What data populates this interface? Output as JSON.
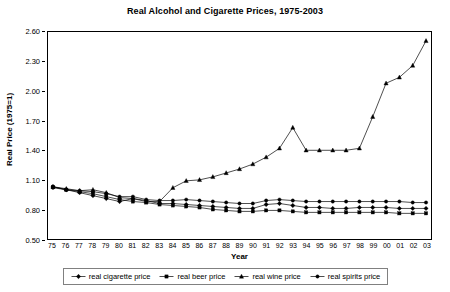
{
  "chart_data": {
    "type": "line",
    "title": "Real Alcohol and Cigarette Prices, 1975-2003",
    "xlabel": "Year",
    "ylabel": "Real Price (1975=1)",
    "xlim": [
      1975,
      2003
    ],
    "ylim": [
      0.5,
      2.6
    ],
    "ytick_step": 0.3,
    "yticks": [
      "2.60",
      "2.30",
      "2.00",
      "1.70",
      "1.40",
      "1.10",
      "0.80",
      "0.50"
    ],
    "ytick_values": [
      2.6,
      2.3,
      2.0,
      1.7,
      1.4,
      1.1,
      0.8,
      0.5
    ],
    "x": [
      1975,
      1976,
      1977,
      1978,
      1979,
      1980,
      1981,
      1982,
      1983,
      1984,
      1985,
      1986,
      1987,
      1988,
      1989,
      1990,
      1991,
      1992,
      1993,
      1994,
      1995,
      1996,
      1997,
      1998,
      1999,
      2000,
      2001,
      2002,
      2003
    ],
    "xticks": [
      "75",
      "76",
      "77",
      "78",
      "79",
      "80",
      "81",
      "82",
      "83",
      "84",
      "85",
      "86",
      "87",
      "88",
      "89",
      "90",
      "91",
      "92",
      "93",
      "94",
      "95",
      "96",
      "97",
      "98",
      "99",
      "00",
      "01",
      "02",
      "03"
    ],
    "grid": false,
    "legend_position": "bottom",
    "series": [
      {
        "name": "real cigarette price",
        "marker": "diamond",
        "color": "#000000",
        "values": [
          1.03,
          1.0,
          0.97,
          0.94,
          0.91,
          0.88,
          0.91,
          0.89,
          0.86,
          0.86,
          0.85,
          0.84,
          0.83,
          0.82,
          0.81,
          0.81,
          0.85,
          0.86,
          0.84,
          0.82,
          0.82,
          0.81,
          0.81,
          0.82,
          0.82,
          0.82,
          0.81,
          0.81,
          0.81
        ]
      },
      {
        "name": "real beer price",
        "marker": "square",
        "color": "#000000",
        "values": [
          1.03,
          1.0,
          0.98,
          0.96,
          0.93,
          0.9,
          0.88,
          0.87,
          0.85,
          0.84,
          0.83,
          0.82,
          0.8,
          0.79,
          0.78,
          0.78,
          0.79,
          0.79,
          0.78,
          0.77,
          0.77,
          0.77,
          0.77,
          0.77,
          0.77,
          0.77,
          0.76,
          0.76,
          0.76
        ]
      },
      {
        "name": "real wine price",
        "marker": "triangle",
        "color": "#000000",
        "values": [
          1.03,
          1.01,
          0.99,
          1.0,
          0.97,
          0.92,
          0.91,
          0.88,
          0.88,
          1.02,
          1.09,
          1.1,
          1.13,
          1.17,
          1.21,
          1.26,
          1.33,
          1.42,
          1.63,
          1.4,
          1.4,
          1.4,
          1.4,
          1.42,
          1.74,
          2.08,
          2.14,
          2.26,
          2.51
        ]
      },
      {
        "name": "real spirits price",
        "marker": "circle",
        "color": "#000000",
        "values": [
          1.02,
          1.0,
          0.99,
          0.98,
          0.96,
          0.93,
          0.93,
          0.9,
          0.89,
          0.89,
          0.9,
          0.89,
          0.88,
          0.87,
          0.86,
          0.86,
          0.89,
          0.9,
          0.89,
          0.88,
          0.88,
          0.88,
          0.88,
          0.88,
          0.88,
          0.88,
          0.88,
          0.87,
          0.87
        ]
      }
    ]
  },
  "legend": {
    "items": [
      {
        "label": "real cigarette price"
      },
      {
        "label": "real beer price"
      },
      {
        "label": "real wine price"
      },
      {
        "label": "real spirits price"
      }
    ]
  }
}
